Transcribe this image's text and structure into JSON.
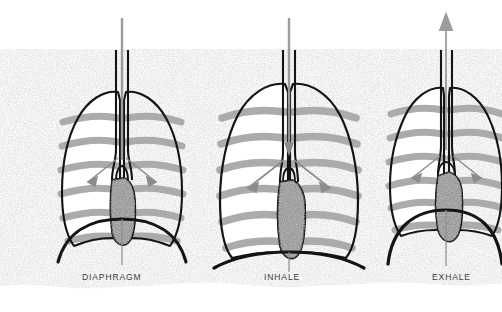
{
  "figure": {
    "type": "anatomical-illustration",
    "background_color": "#ffffff",
    "texture_color": "#b4b4b4",
    "outline_color": "#141414",
    "rib_color": "#ababab",
    "lung_fill": "#ffffff",
    "heart_color": "#8f8f8f",
    "arrow_color": "#8c8c8c",
    "label_color": "#3a3a3a"
  },
  "panels": [
    {
      "id": "panel-diaphragm",
      "label": "DIAPHRAGM",
      "label_x": 82,
      "label_y": 272,
      "center_x": 120,
      "airflow_arrow": "none",
      "diaphragm_state": "domed",
      "lung_state": "neutral"
    },
    {
      "id": "panel-inhale",
      "label": "INHALE",
      "label_x": 264,
      "label_y": 272,
      "center_x": 288,
      "airflow_arrow": "down",
      "diaphragm_state": "flattened",
      "lung_state": "expanded"
    },
    {
      "id": "panel-exhale",
      "label": "EXHALE",
      "label_x": 432,
      "label_y": 272,
      "center_x": 445,
      "airflow_arrow": "up",
      "diaphragm_state": "high-dome",
      "lung_state": "contracted"
    }
  ]
}
